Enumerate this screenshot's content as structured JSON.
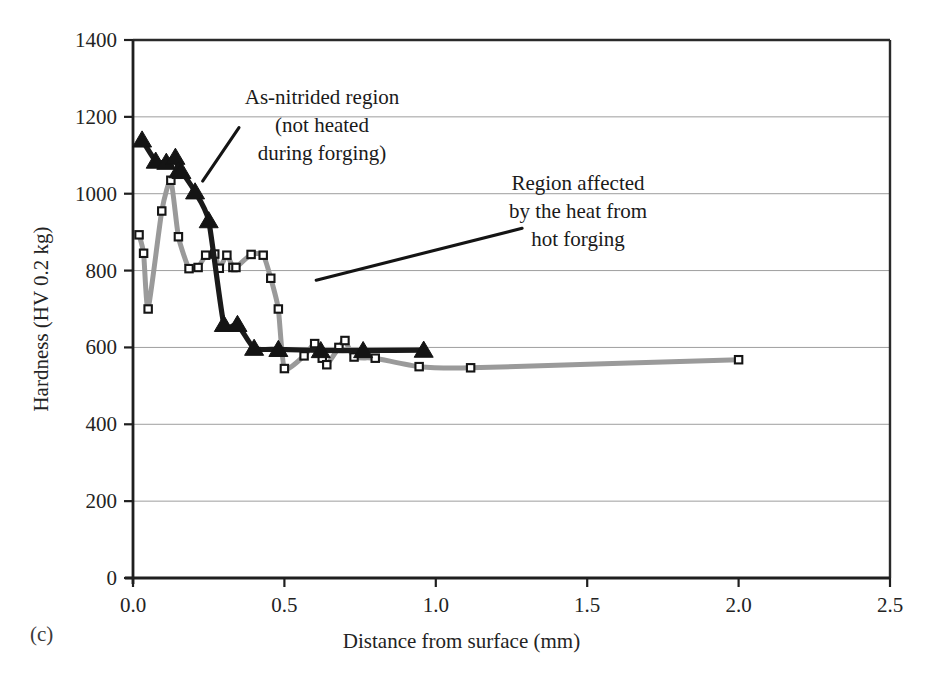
{
  "figure": {
    "panel_label": "(c)"
  },
  "chart_data": {
    "type": "scatter",
    "title": "",
    "xlabel": "Distance from surface (mm)",
    "ylabel": "Hardness (HV 0.2 kg)",
    "xlim": [
      0.0,
      2.5
    ],
    "ylim": [
      0,
      1400
    ],
    "xticks": [
      "0.0",
      "0.5",
      "1.0",
      "1.5",
      "2.0",
      "2.5"
    ],
    "xtick_values": [
      0.0,
      0.5,
      1.0,
      1.5,
      2.0,
      2.5
    ],
    "yticks": [
      "0",
      "200",
      "400",
      "600",
      "800",
      "1000",
      "1200",
      "1400"
    ],
    "ytick_values": [
      0,
      200,
      400,
      600,
      800,
      1000,
      1200,
      1400
    ],
    "grid": "horizontal",
    "legend_position": "none",
    "series": [
      {
        "name": "As-nitrided region (not heated during forging)",
        "marker": "filled-triangle",
        "color": "#1a1a1a",
        "line_color": "#1a1a1a",
        "points": [
          [
            0.03,
            1140
          ],
          [
            0.075,
            1085
          ],
          [
            0.11,
            1082
          ],
          [
            0.14,
            1095
          ],
          [
            0.15,
            1060
          ],
          [
            0.16,
            1058
          ],
          [
            0.205,
            1005
          ],
          [
            0.25,
            930
          ],
          [
            0.3,
            660
          ],
          [
            0.345,
            660
          ],
          [
            0.4,
            598
          ],
          [
            0.48,
            595
          ],
          [
            0.62,
            592
          ],
          [
            0.76,
            592
          ],
          [
            0.96,
            593
          ]
        ]
      },
      {
        "name": "Region affected by the heat from hot forging",
        "marker": "open-square",
        "color": "#8c8c8c",
        "line_color": "#9a9a9a",
        "points": [
          [
            0.02,
            893
          ],
          [
            0.035,
            845
          ],
          [
            0.05,
            700
          ],
          [
            0.095,
            955
          ],
          [
            0.125,
            1035
          ],
          [
            0.15,
            888
          ],
          [
            0.185,
            805
          ],
          [
            0.215,
            808
          ],
          [
            0.24,
            840
          ],
          [
            0.27,
            843
          ],
          [
            0.285,
            806
          ],
          [
            0.31,
            840
          ],
          [
            0.33,
            808
          ],
          [
            0.34,
            808
          ],
          [
            0.39,
            842
          ],
          [
            0.43,
            840
          ],
          [
            0.455,
            780
          ],
          [
            0.48,
            700
          ],
          [
            0.5,
            545
          ],
          [
            0.565,
            578
          ],
          [
            0.6,
            610
          ],
          [
            0.625,
            572
          ],
          [
            0.64,
            555
          ],
          [
            0.68,
            600
          ],
          [
            0.7,
            618
          ],
          [
            0.73,
            575
          ],
          [
            0.8,
            572
          ],
          [
            0.945,
            550
          ],
          [
            1.115,
            547
          ],
          [
            2.0,
            568
          ]
        ]
      }
    ],
    "annotations": [
      {
        "id": "as-nitrided",
        "lines": [
          "As-nitrided region",
          "(not heated",
          "during forging)"
        ],
        "leader_from": [
          0.35,
          1172
        ],
        "leader_to": [
          0.23,
          1033
        ]
      },
      {
        "id": "heat-affected",
        "lines": [
          "Region affected",
          "by the heat from",
          "hot forging"
        ],
        "leader_from": [
          1.285,
          910
        ],
        "leader_to": [
          0.605,
          775
        ]
      }
    ]
  }
}
